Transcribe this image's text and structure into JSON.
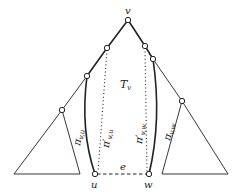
{
  "diagram": {
    "type": "tree-path-diagram",
    "labels": {
      "root": "v",
      "left_leaf": "u",
      "right_leaf": "w",
      "edge": "e",
      "subtree": "T",
      "subtree_sub": "v",
      "pi_vu": "π",
      "pi_vu_sub": "v,u",
      "pi_prime_vu": "π′",
      "pi_prime_vu_sub": "v,u",
      "pi_prime_vw": "π′",
      "pi_prime_vw_sub": "v,w",
      "pi_vw": "π",
      "pi_vw_sub": "v,w"
    },
    "colors": {
      "stroke": "#222222",
      "background": "#ffffff",
      "node_fill": "#ffffff"
    }
  }
}
